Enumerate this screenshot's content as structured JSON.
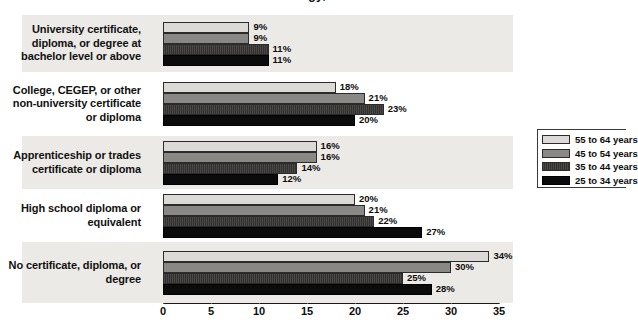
{
  "title_partial": "...logy, ...",
  "chart_data": {
    "type": "bar",
    "orientation": "horizontal",
    "title": "",
    "xlabel": "",
    "ylabel": "",
    "xlim": [
      0,
      35
    ],
    "xticks": [
      0,
      5,
      10,
      15,
      20,
      25,
      30,
      35
    ],
    "xtick_labels": [
      "0",
      "5",
      "10",
      "15",
      "20",
      "25",
      "30",
      "35"
    ],
    "grid": false,
    "value_suffix": "%",
    "legend_position": "right",
    "categories": [
      "University certificate, diploma, or degree at bachelor level or above",
      "College, CEGEP, or other non-university certificate or diploma",
      "Apprenticeship or trades certificate or diploma",
      "High school diploma or equivalent",
      "No certificate, diploma, or degree"
    ],
    "category_lines": [
      [
        "University certificate,",
        "diploma, or degree at",
        "bachelor level or above"
      ],
      [
        "College, CEGEP, or other",
        "non-university certificate",
        "or diploma"
      ],
      [
        "Apprenticeship or trades",
        "certificate or diploma"
      ],
      [
        "High school diploma or",
        "equivalent"
      ],
      [
        "No certificate, diploma, or",
        "degree"
      ]
    ],
    "series": [
      {
        "name": "55 to 64 years",
        "color": "#dcdad6",
        "values": [
          9,
          18,
          16,
          20,
          34
        ],
        "labels": [
          "9%",
          "18%",
          "16%",
          "20%",
          "34%"
        ]
      },
      {
        "name": "45 to 54 years",
        "color": "#8a8885",
        "values": [
          9,
          21,
          16,
          21,
          30
        ],
        "labels": [
          "9%",
          "21%",
          "16%",
          "21%",
          "30%"
        ]
      },
      {
        "name": "35 to 44 years",
        "color": "#3e3c3a",
        "values": [
          11,
          23,
          14,
          22,
          25
        ],
        "labels": [
          "11%",
          "23%",
          "14%",
          "22%",
          "25%"
        ]
      },
      {
        "name": "25 to 34 years",
        "color": "#0b0b0b",
        "values": [
          11,
          20,
          12,
          27,
          28
        ],
        "labels": [
          "11%",
          "20%",
          "12%",
          "27%",
          "28%"
        ]
      }
    ]
  },
  "legend": {
    "items": [
      {
        "label": "55 to 64 years",
        "swatch": "swatch-light-gray"
      },
      {
        "label": "45 to 54 years",
        "swatch": "swatch-medium-gray"
      },
      {
        "label": "35 to 44 years",
        "swatch": "swatch-dark-gray"
      },
      {
        "label": "25 to 34 years",
        "swatch": "swatch-black"
      }
    ]
  }
}
